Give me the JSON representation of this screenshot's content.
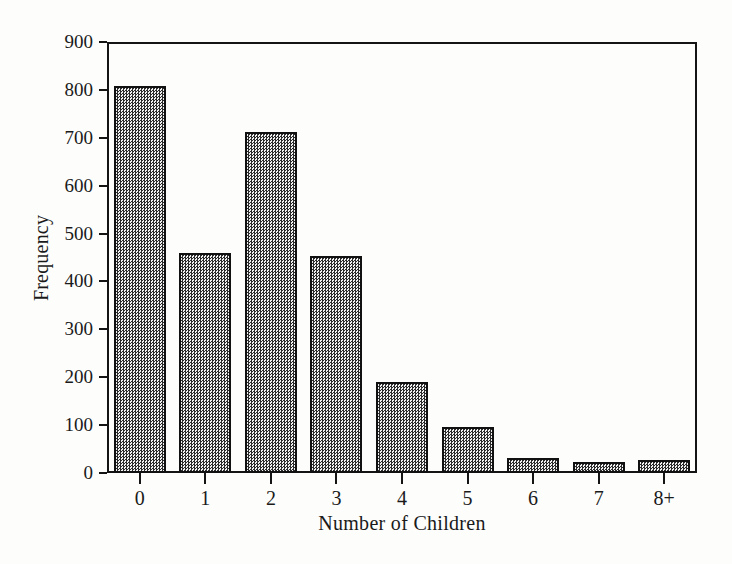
{
  "chart_data": {
    "type": "bar",
    "title": "",
    "subtitle": "",
    "xlabel": "Number of Children",
    "ylabel": "Frequency",
    "categories": [
      "0",
      "1",
      "2",
      "3",
      "4",
      "5",
      "6",
      "7",
      "8+"
    ],
    "values": [
      808,
      460,
      712,
      453,
      189,
      97,
      32,
      23,
      27
    ],
    "ylim": [
      0,
      900
    ],
    "yticks": [
      0,
      100,
      200,
      300,
      400,
      500,
      600,
      700,
      800,
      900
    ],
    "ytick_labels": [
      "0",
      "100",
      "200",
      "300",
      "400",
      "500",
      "600",
      "700",
      "800",
      "900"
    ],
    "grid": false,
    "legend": null,
    "bar_fill": "checkered-gray-dither",
    "bar_edge_color": "#111111",
    "frame_color": "#141414",
    "background_color": "#fdfdfc"
  },
  "axes": {
    "y_title": "Frequency",
    "x_title": "Number of Children"
  }
}
